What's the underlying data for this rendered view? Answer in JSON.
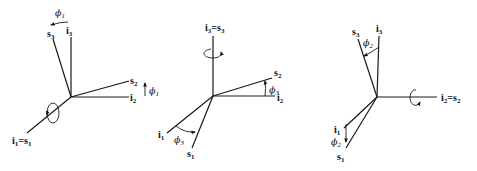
{
  "figure": {
    "panels": [
      {
        "id": "rotation-phi1",
        "labels": {
          "i1_eq_s1": "i",
          "i1_sub": "1",
          "eq": "=",
          "s1_base": "s",
          "s1_sub": "1",
          "i2": "i",
          "i2_sub": "2",
          "s2": "s",
          "s2_sub": "2",
          "i3": "i",
          "i3_sub": "3",
          "s3": "s",
          "s3_sub": "3",
          "angle_top": "ϕ",
          "angle_top_sub": "1",
          "angle_right": "ϕ",
          "angle_right_sub": "1"
        }
      },
      {
        "id": "rotation-phi3",
        "labels": {
          "i3": "i",
          "i3_sub": "3",
          "eq": "=",
          "s3": "s",
          "s3_sub": "3",
          "i2": "i",
          "i2_sub": "2",
          "s2": "s",
          "s2_sub": "2",
          "i1": "i",
          "i1_sub": "1",
          "s1": "s",
          "s1_sub": "1",
          "angle_right": "ϕ",
          "angle_right_sub": "3",
          "angle_bottom": "ϕ",
          "angle_bottom_sub": "3"
        }
      },
      {
        "id": "rotation-phi2",
        "labels": {
          "i3": "i",
          "i3_sub": "3",
          "s3": "s",
          "s3_sub": "3",
          "i2": "i",
          "i2_sub": "2",
          "eq": "=",
          "s2": "s",
          "s2_sub": "2",
          "i1": "i",
          "i1_sub": "1",
          "s1": "s",
          "s1_sub": "1",
          "angle_top": "ϕ",
          "angle_top_sub": "2",
          "angle_bottom": "ϕ",
          "angle_bottom_sub": "2"
        }
      }
    ]
  }
}
